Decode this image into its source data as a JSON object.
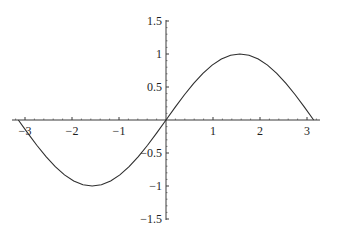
{
  "chart_data": {
    "type": "line",
    "title": "",
    "xlabel": "",
    "ylabel": "",
    "function": "sin(x)",
    "xlim": [
      -3.1416,
      3.1416
    ],
    "ylim": [
      -1.5,
      1.5
    ],
    "grid": false,
    "legend": null,
    "x_ticks": [
      -3,
      -2,
      -1,
      1,
      2,
      3
    ],
    "x_tick_labels": [
      "−3",
      "−2",
      "−1",
      "1",
      "2",
      "3"
    ],
    "y_ticks": [
      1.5,
      1,
      0.5,
      -0.5,
      -1,
      -1.5
    ],
    "y_tick_labels": [
      "1.5",
      "1",
      "0.5",
      "−0.5",
      "−1",
      "−1.5"
    ],
    "series": [
      {
        "name": "sin(x)",
        "color": "#2e2e2e",
        "x": [
          -3.1416,
          -2.9452,
          -2.7489,
          -2.5525,
          -2.3562,
          -2.1598,
          -1.9635,
          -1.7671,
          -1.5708,
          -1.3744,
          -1.1781,
          -0.9817,
          -0.7854,
          -0.589,
          -0.3927,
          -0.1963,
          0,
          0.1963,
          0.3927,
          0.589,
          0.7854,
          0.9817,
          1.1781,
          1.3744,
          1.5708,
          1.7671,
          1.9635,
          2.1598,
          2.3562,
          2.5525,
          2.7489,
          2.9452,
          3.1416
        ],
        "y": [
          0,
          -0.1951,
          -0.3827,
          -0.5556,
          -0.7071,
          -0.8315,
          -0.9239,
          -0.9808,
          -1,
          -0.9808,
          -0.9239,
          -0.8315,
          -0.7071,
          -0.5556,
          -0.3827,
          -0.1951,
          0,
          0.1951,
          0.3827,
          0.5556,
          0.7071,
          0.8315,
          0.9239,
          0.9808,
          1,
          0.9808,
          0.9239,
          0.8315,
          0.7071,
          0.5556,
          0.3827,
          0.1951,
          0
        ]
      }
    ]
  },
  "layout": {
    "origin_px": [
      166,
      120
    ],
    "x_scale_px": 47,
    "y_scale_px": 66,
    "x_axis_px_range": [
      12,
      320
    ],
    "y_axis_px_range": [
      20,
      220
    ]
  }
}
